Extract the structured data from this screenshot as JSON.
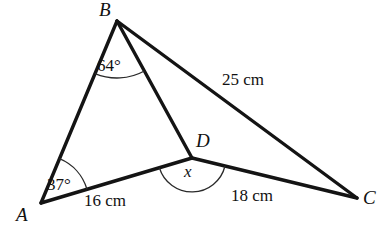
{
  "figure": {
    "kind": "geometry-diagram",
    "background_color": "#ffffff",
    "stroke_color": "#141414",
    "arc_color": "#2a2a2a"
  },
  "vertices": {
    "A": {
      "label": "A",
      "x": 41,
      "y": 203
    },
    "B": {
      "label": "B",
      "x": 117,
      "y": 21
    },
    "C": {
      "label": "C",
      "x": 357,
      "y": 198
    },
    "D": {
      "label": "D",
      "x": 192,
      "y": 158
    }
  },
  "segments": [
    {
      "name": "AB",
      "from": "A",
      "to": "B"
    },
    {
      "name": "BD",
      "from": "B",
      "to": "D"
    },
    {
      "name": "BC",
      "from": "B",
      "to": "C"
    },
    {
      "name": "AD",
      "from": "A",
      "to": "D"
    },
    {
      "name": "DC",
      "from": "D",
      "to": "C"
    }
  ],
  "angles": {
    "at_B": {
      "label": "64°",
      "value": 64,
      "unit": "degrees",
      "vertex": "B",
      "between": [
        "BA",
        "BD"
      ]
    },
    "at_A": {
      "label": "37°",
      "value": 37,
      "unit": "degrees",
      "vertex": "A",
      "between": [
        "AB",
        "AC"
      ]
    },
    "at_D": {
      "label": "x",
      "value": null,
      "unit": "degrees",
      "vertex": "D",
      "between": [
        "DA",
        "DC"
      ],
      "is_unknown": true
    }
  },
  "lengths": {
    "AD": {
      "label": "16 cm",
      "value": 16,
      "unit": "cm",
      "segment": "AD"
    },
    "DC": {
      "label": "18 cm",
      "value": 18,
      "unit": "cm",
      "segment": "DC"
    },
    "BC": {
      "label": "25 cm",
      "value": 25,
      "unit": "cm",
      "segment": "BC"
    }
  }
}
